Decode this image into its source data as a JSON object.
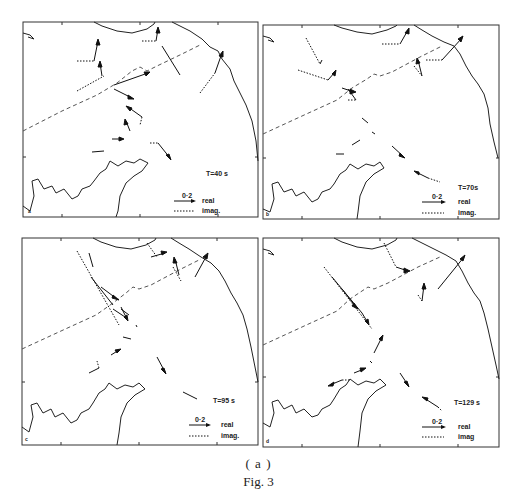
{
  "figure": {
    "subcaption": "( a )",
    "caption": "Fig. 3",
    "colors": {
      "ink": "#1a1a1a",
      "frame": "#333333",
      "dashed_boundary": "#555555"
    }
  },
  "legend": {
    "scale_label": "0·2",
    "real_label": "real",
    "imag_label": "imag."
  },
  "panels": [
    {
      "id": "a",
      "letter": "a",
      "period_label": "T=40 s",
      "scale_label": "0·2",
      "real_label": "real",
      "imag_label": "imag."
    },
    {
      "id": "b",
      "letter": "b",
      "period_label": "T=70s",
      "scale_label": "0·2",
      "real_label": "real",
      "imag_label": "imag."
    },
    {
      "id": "c",
      "letter": "c",
      "period_label": "T=95 s",
      "scale_label": "0·2",
      "real_label": "real",
      "imag_label": "imag."
    },
    {
      "id": "d",
      "letter": "d",
      "period_label": "T=129 s",
      "scale_label": "0·2",
      "real_label": "real",
      "imag_label": "imag"
    }
  ]
}
